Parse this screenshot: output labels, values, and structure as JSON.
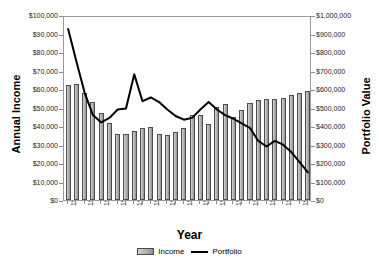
{
  "chart_data": {
    "type": "bar",
    "title": "",
    "xlabel": "Year",
    "ylabel": "Annual Income",
    "y2label": "Portfolio Value",
    "grid": false,
    "legend_position": "bottom",
    "ylim": [
      0,
      100000
    ],
    "y2lim": [
      0,
      1000000
    ],
    "y_ticks": [
      "$0",
      "$10,000",
      "$20,000",
      "$30,000",
      "$40,000",
      "$50,000",
      "$60,000",
      "$70,000",
      "$80,000",
      "$90,000",
      "$100,000"
    ],
    "y2_ticks": [
      "$0",
      "$100,000",
      "$200,000",
      "$300,000",
      "$400,000",
      "$500,000",
      "$600,000",
      "$700,000",
      "$800,000",
      "$900,000",
      "$1,000,000"
    ],
    "categories": [
      1929,
      1930,
      1931,
      1932,
      1933,
      1934,
      1935,
      1936,
      1937,
      1938,
      1939,
      1940,
      1941,
      1942,
      1943,
      1944,
      1945,
      1946,
      1947,
      1948,
      1949,
      1950,
      1951,
      1952,
      1953,
      1954,
      1955,
      1956,
      1957,
      1958
    ],
    "x_tick_labels": [
      "1929",
      "1931",
      "1933",
      "1935",
      "1937",
      "1939",
      "1941",
      "1943",
      "1945",
      "1947",
      "1949",
      "1951",
      "1953",
      "1955",
      "1957"
    ],
    "series": [
      {
        "name": "Income",
        "type": "bar",
        "axis": "left",
        "color": "#a8a8a8",
        "values": [
          62000,
          62500,
          58000,
          53000,
          47000,
          41500,
          35500,
          35500,
          37500,
          39000,
          39500,
          35500,
          35000,
          36500,
          39000,
          46000,
          46000,
          41000,
          50500,
          52000,
          45000,
          48500,
          52500,
          54000,
          54500,
          54500,
          55000,
          57000,
          58000,
          59000
        ]
      },
      {
        "name": "Portfolio",
        "type": "line",
        "axis": "right",
        "color": "#000000",
        "values": [
          935000,
          760000,
          590000,
          470000,
          430000,
          455000,
          500000,
          505000,
          690000,
          545000,
          565000,
          540000,
          500000,
          465000,
          445000,
          455000,
          500000,
          540000,
          500000,
          470000,
          450000,
          425000,
          400000,
          330000,
          300000,
          330000,
          310000,
          270000,
          215000,
          160000
        ]
      }
    ]
  },
  "legend": {
    "entries": [
      {
        "label": "Income",
        "marker": "bar-swatch"
      },
      {
        "label": "Portfolio",
        "marker": "line-swatch"
      }
    ]
  }
}
